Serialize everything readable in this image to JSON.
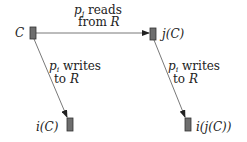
{
  "nodes": {
    "c": {
      "label": "C"
    },
    "jc": {
      "label": "j(C)"
    },
    "ic": {
      "label": "i(C)"
    },
    "ijc": {
      "label": "i(j(C))"
    }
  },
  "edges": {
    "reads": {
      "var": "p",
      "sub": "j",
      "line1": " reads",
      "line2_text": "from ",
      "line2_var": "R"
    },
    "writes_left": {
      "var": "p",
      "sub": "i",
      "line1": " writes",
      "line2_text": "to ",
      "line2_var": "R"
    },
    "writes_right": {
      "var": "p",
      "sub": "i",
      "line1": " writes",
      "line2_text": "to ",
      "line2_var": "R"
    }
  },
  "colors": {
    "box_fill": "#6e6e6e",
    "box_stroke": "#333333",
    "line": "#444444"
  }
}
